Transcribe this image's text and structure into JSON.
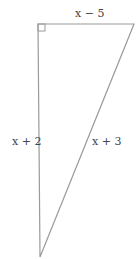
{
  "diagram": {
    "type": "right-triangle",
    "labels": {
      "top": "x − 5",
      "left": "x + 2",
      "hypotenuse": "x + 3"
    },
    "right_angle_marker": "top-left",
    "colors": {
      "stroke": "#9a9a9a",
      "text": "#444444"
    }
  }
}
